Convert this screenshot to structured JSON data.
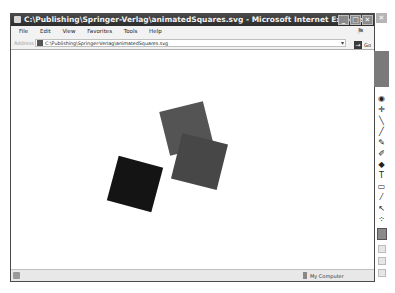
{
  "window": {
    "title": "C:\\Publishing\\Springer-Verlag\\animatedSquares.svg - Microsoft Internet Explorer",
    "controls": {
      "minimize": "_",
      "maximize": "□",
      "close": "✕"
    }
  },
  "menubar": {
    "items": [
      {
        "label": "File"
      },
      {
        "label": "Edit"
      },
      {
        "label": "View"
      },
      {
        "label": "Favorites"
      },
      {
        "label": "Tools"
      },
      {
        "label": "Help"
      }
    ]
  },
  "addressbar": {
    "label": "Address",
    "value": "C:\\Publishing\\Springer-Verlag\\animatedSquares.svg",
    "dropdown": "▾",
    "go_label": "Go",
    "go_icon": "→"
  },
  "content": {
    "squares": [
      {
        "name": "square-top",
        "color": "#545454",
        "x": 164,
        "y": 106,
        "size": 45,
        "rotate": -14
      },
      {
        "name": "square-right",
        "color": "#474747",
        "x": 176,
        "y": 138,
        "size": 47,
        "rotate": 14
      },
      {
        "name": "square-dark",
        "color": "#141414",
        "x": 112,
        "y": 161,
        "size": 46,
        "rotate": 15
      }
    ]
  },
  "statusbar": {
    "zone": "My Computer"
  },
  "side_panel": {
    "close": "✕",
    "tools": [
      {
        "name": "select-tool",
        "glyph": "◉"
      },
      {
        "name": "node-tool",
        "glyph": "✛"
      },
      {
        "name": "line-tool",
        "glyph": "╲"
      },
      {
        "name": "pen-tool",
        "glyph": "╱"
      },
      {
        "name": "pencil-tool",
        "glyph": "✎"
      },
      {
        "name": "brush-tool",
        "glyph": "✐"
      },
      {
        "name": "fill-tool",
        "glyph": "◆"
      },
      {
        "name": "text-tool",
        "glyph": "T"
      },
      {
        "name": "rect-tool",
        "glyph": "▭"
      },
      {
        "name": "eyedropper-tool",
        "glyph": "⁄"
      },
      {
        "name": "zoom-tool",
        "glyph": "↖"
      },
      {
        "name": "spray-tool",
        "glyph": "⁘"
      }
    ],
    "swatch_color": "#8a8a8a"
  }
}
